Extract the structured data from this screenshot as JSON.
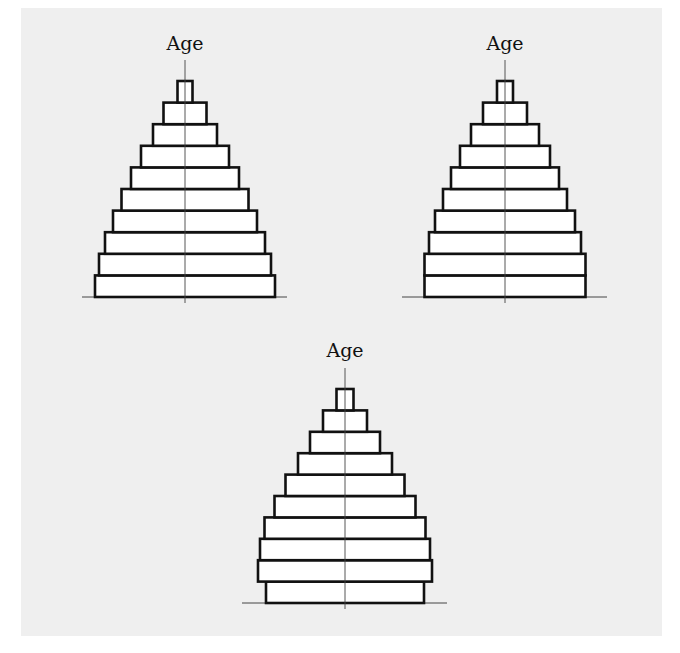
{
  "figure": {
    "background": "#efefef",
    "bar_fill": "#ffffff",
    "bar_stroke": "#111111",
    "axis_color": "#444444"
  },
  "chart_data": [
    {
      "type": "bar",
      "subtype": "population-pyramid",
      "title": "",
      "ylabel": "Age",
      "xlabel": "",
      "position": "top-left",
      "center_x": 185,
      "baseline_y": 297,
      "bar_height": 21.6,
      "age_groups_bottom_to_top": [
        1,
        2,
        3,
        4,
        5,
        6,
        7,
        8,
        9,
        10
      ],
      "half_widths_bottom_to_top": [
        90,
        86,
        80,
        72,
        63.5,
        54,
        44,
        32,
        21.5,
        7.5
      ],
      "axis_top_y": 60,
      "baseline_x_range": [
        82,
        287
      ]
    },
    {
      "type": "bar",
      "subtype": "population-pyramid",
      "title": "",
      "ylabel": "Age",
      "xlabel": "",
      "position": "top-right",
      "center_x": 505,
      "baseline_y": 297,
      "bar_height": 21.6,
      "age_groups_bottom_to_top": [
        1,
        2,
        3,
        4,
        5,
        6,
        7,
        8,
        9,
        10
      ],
      "half_widths_bottom_to_top": [
        80.5,
        80.5,
        76,
        70,
        62,
        54,
        45,
        34,
        22,
        8
      ],
      "axis_top_y": 60,
      "baseline_x_range": [
        402,
        607
      ]
    },
    {
      "type": "bar",
      "subtype": "population-pyramid",
      "title": "",
      "ylabel": "Age",
      "xlabel": "",
      "position": "bottom-center",
      "center_x": 345,
      "baseline_y": 603,
      "bar_height": 21.4,
      "age_groups_bottom_to_top": [
        1,
        2,
        3,
        4,
        5,
        6,
        7,
        8,
        9,
        10
      ],
      "half_widths_bottom_to_top": [
        79,
        87,
        85,
        80.5,
        70.5,
        59.5,
        47,
        35,
        22,
        8.5
      ],
      "axis_top_y": 368,
      "baseline_x_range": [
        242,
        447
      ]
    }
  ],
  "labels": {
    "pyramid1_axis": "Age",
    "pyramid2_axis": "Age",
    "pyramid3_axis": "Age"
  }
}
